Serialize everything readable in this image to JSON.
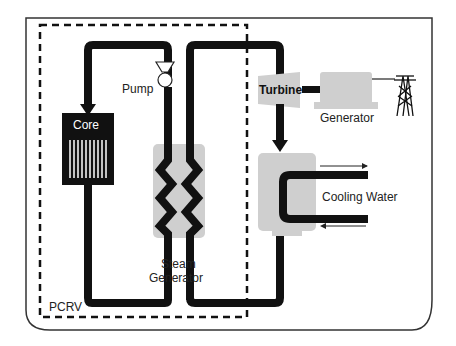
{
  "diagram": {
    "labels": {
      "pump": "Pump",
      "core": "Core",
      "steam_generator_line1": "Steam",
      "steam_generator_line2": "Generator",
      "pcrv": "PCRV",
      "turbine": "Turbine",
      "generator": "Generator",
      "cooling_water": "Cooling Water"
    },
    "colors": {
      "pipe": "#111111",
      "component_fill": "#cfcfcf",
      "frame": "#333333",
      "background": "#ffffff"
    }
  }
}
